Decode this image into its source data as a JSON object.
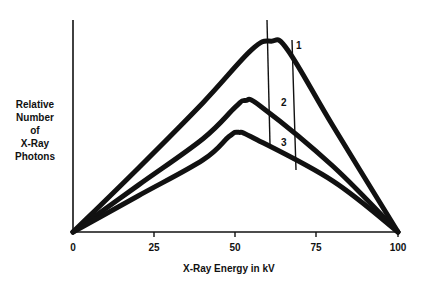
{
  "chart_data": {
    "type": "line",
    "title": "",
    "xlabel": "X-Ray Energy in kV",
    "ylabel": "Relative Number of X-Ray Photons",
    "ylabel_lines": [
      "Relative",
      "Number",
      "of",
      "X-Ray",
      "Photons"
    ],
    "xlim": [
      0,
      100
    ],
    "ylim": [
      0,
      100
    ],
    "x_ticks": [
      0,
      25,
      50,
      75,
      100
    ],
    "x_tick_labels": [
      "0",
      "25",
      "50",
      "75",
      "100"
    ],
    "y_ticks": [],
    "grid": false,
    "legend": "none (curves labeled inline 1, 2, 3)",
    "series": [
      {
        "name": "1",
        "x": [
          0,
          20,
          40,
          55,
          61,
          66,
          80,
          100
        ],
        "values": [
          0,
          30,
          61,
          86,
          90,
          86,
          50,
          0
        ]
      },
      {
        "name": "2",
        "x": [
          0,
          20,
          40,
          50,
          53,
          58,
          80,
          100
        ],
        "values": [
          0,
          22,
          44,
          59,
          62,
          59,
          31,
          0
        ]
      },
      {
        "name": "3",
        "x": [
          0,
          20,
          40,
          48,
          51,
          56,
          80,
          100
        ],
        "values": [
          0,
          17,
          34,
          45,
          47,
          44,
          24,
          0
        ]
      }
    ],
    "annotations": [
      {
        "type": "vertical-line",
        "x": 60,
        "y_from": 100,
        "y_to": 41,
        "note": "line crossing curve peaks near 60 kV"
      },
      {
        "type": "vertical-line",
        "x": 68,
        "y_from": 91,
        "y_to": 29,
        "note": "second vertical line near 68 kV"
      },
      {
        "type": "label",
        "text": "1",
        "x": 69,
        "y": 87
      },
      {
        "type": "label",
        "text": "2",
        "x": 64,
        "y": 63
      },
      {
        "type": "label",
        "text": "3",
        "x": 64,
        "y": 41
      }
    ]
  },
  "labels": {
    "curve1": "1",
    "curve2": "2",
    "curve3": "3",
    "y1": "Relative",
    "y2": "Number",
    "y3": "of",
    "y4": "X-Ray",
    "y5": "Photons",
    "x_title": "X-Ray Energy in kV",
    "t0": "0",
    "t25": "25",
    "t50": "50",
    "t75": "75",
    "t100": "100"
  },
  "colors": {
    "ink": "#111111",
    "background": "#ffffff"
  }
}
